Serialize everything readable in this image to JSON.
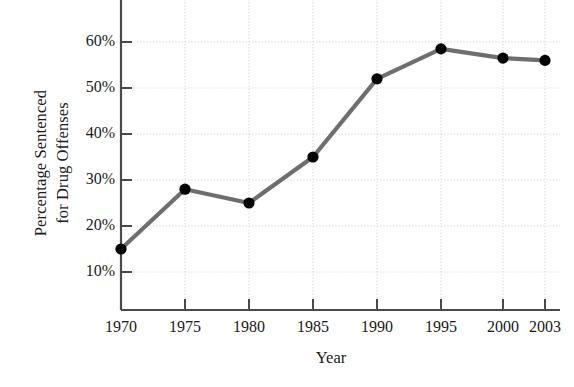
{
  "chart_data": {
    "type": "line",
    "title": "",
    "subtitle": "",
    "xlabel": "Year",
    "ylabel": "Percentage Sentenced for Drug Offenses",
    "ylabel_lines": [
      "Percentage Sentenced",
      "for Drug Offenses"
    ],
    "x": [
      1970,
      1975,
      1980,
      1985,
      1990,
      1995,
      2000,
      2003
    ],
    "xtick_labels": [
      "1970",
      "1975",
      "1980",
      "1985",
      "1990",
      "1995",
      "2000",
      "2003"
    ],
    "values": [
      15,
      28,
      25,
      35,
      52,
      58.5,
      56.5,
      56
    ],
    "ytick_values": [
      10,
      20,
      30,
      40,
      50,
      60,
      70
    ],
    "ytick_labels": [
      "10%",
      "20%",
      "30%",
      "40%",
      "50%",
      "60%",
      "70%"
    ],
    "ylim": [
      5,
      70
    ],
    "xlim": [
      1970,
      2003
    ],
    "grid": true,
    "grid_style": "dotted",
    "legend": "none",
    "series": [
      {
        "name": "Percentage Sentenced for Drug Offenses",
        "values": [
          15,
          28,
          25,
          35,
          52,
          58.5,
          56.5,
          56
        ]
      }
    ],
    "colors": {
      "line": "#6e6e6e",
      "marker": "#000000",
      "axis": "#4a4a4a",
      "grid": "#cccccc",
      "background": "#ffffff",
      "text": "#1a1a1a"
    },
    "notes": {
      "top_label_clipped": "70%"
    }
  }
}
